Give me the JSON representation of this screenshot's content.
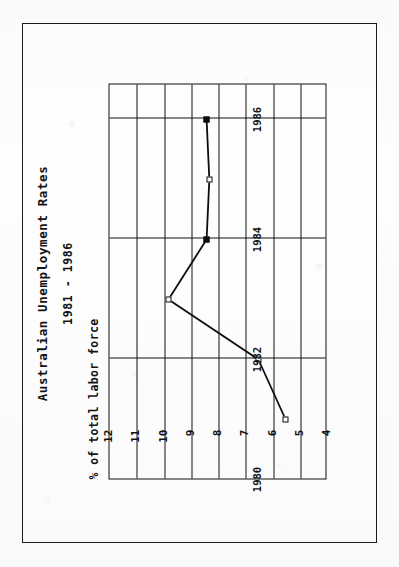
{
  "document": {
    "page_background": "#fdfdfd",
    "border_color": "#1a1a1a",
    "orientation": "rotated-90-ccw"
  },
  "chart_data": {
    "type": "line",
    "title": "Australian Unemployment Rates",
    "subtitle": "1981 - 1986",
    "xlabel": "",
    "ylabel": "% of total labor force",
    "x": [
      1981,
      1982,
      1983,
      1984,
      1985,
      1986
    ],
    "values": [
      5.5,
      6.5,
      9.8,
      8.4,
      8.3,
      8.4
    ],
    "series": [
      {
        "name": "Unemployment rate",
        "values": [
          5.5,
          6.5,
          9.8,
          8.4,
          8.3,
          8.4
        ]
      }
    ],
    "xlim": [
      1980,
      1986.6
    ],
    "ylim": [
      4,
      12
    ],
    "xticks": [
      1980,
      1982,
      1984,
      1986
    ],
    "xtick_labels": [
      "1980",
      "1982",
      "1984",
      "1986"
    ],
    "yticks": [
      4,
      5,
      6,
      7,
      8,
      9,
      10,
      11,
      12
    ],
    "ytick_labels": [
      "4",
      "5",
      "6",
      "7",
      "8",
      "9",
      "10",
      "11",
      "12"
    ],
    "grid": "both",
    "legend": "none",
    "line_color": "#0d0d0d",
    "marker": "square-open"
  }
}
